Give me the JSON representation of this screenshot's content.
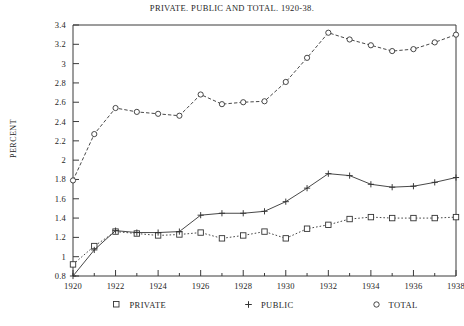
{
  "chart_data": {
    "type": "line",
    "title": "PRIVATE. PUBLIC AND TOTAL. 1920-38.",
    "xlabel": "",
    "ylabel": "PERCENT",
    "xlim": [
      1920,
      1938
    ],
    "ylim": [
      0.8,
      3.4
    ],
    "ytick_step": 0.2,
    "xtick_step": 2,
    "minor_xticks": true,
    "grid": false,
    "legend_position": "bottom",
    "x": [
      1920,
      1921,
      1922,
      1923,
      1924,
      1925,
      1926,
      1927,
      1928,
      1929,
      1930,
      1931,
      1932,
      1933,
      1934,
      1935,
      1936,
      1937,
      1938
    ],
    "xtick_labels": [
      "1920",
      "1922",
      "1924",
      "1926",
      "1928",
      "1930",
      "1932",
      "1934",
      "1936",
      "1938"
    ],
    "ytick_labels": [
      "0.8",
      "1",
      "1.2",
      "1.4",
      "1.6",
      "1.8",
      "2",
      "2.2",
      "2.4",
      "2.6",
      "2.8",
      "3",
      "3.2",
      "3.4"
    ],
    "series": [
      {
        "name": "PRIVATE",
        "marker": "open-square",
        "linestyle": "dotted",
        "color": "#333333",
        "values": [
          0.92,
          1.11,
          1.26,
          1.24,
          1.22,
          1.23,
          1.25,
          1.19,
          1.22,
          1.26,
          1.19,
          1.29,
          1.33,
          1.39,
          1.41,
          1.4,
          1.4,
          1.4,
          1.41
        ]
      },
      {
        "name": "PUBLIC",
        "marker": "plus",
        "linestyle": "solid",
        "color": "#333333",
        "values": [
          0.8,
          1.07,
          1.27,
          1.25,
          1.25,
          1.26,
          1.43,
          1.45,
          1.45,
          1.47,
          1.57,
          1.71,
          1.86,
          1.84,
          1.75,
          1.72,
          1.73,
          1.77,
          1.82
        ]
      },
      {
        "name": "TOTAL",
        "marker": "open-circle",
        "linestyle": "dashed-dotted",
        "color": "#333333",
        "values": [
          1.79,
          2.27,
          2.54,
          2.5,
          2.48,
          2.46,
          2.68,
          2.58,
          2.6,
          2.61,
          2.81,
          3.06,
          3.32,
          3.25,
          3.19,
          3.13,
          3.15,
          3.22,
          3.3
        ]
      }
    ]
  },
  "legend": {
    "items": [
      {
        "label": "PRIVATE",
        "marker": "open-square"
      },
      {
        "label": "PUBLIC",
        "marker": "plus"
      },
      {
        "label": "TOTAL",
        "marker": "open-circle"
      }
    ]
  }
}
